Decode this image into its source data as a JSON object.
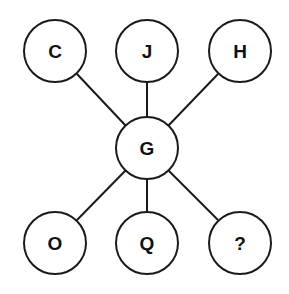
{
  "diagram": {
    "type": "letter-puzzle",
    "center": {
      "id": "G",
      "label": "G",
      "x": 147,
      "y": 148
    },
    "nodes": [
      {
        "id": "C",
        "label": "C",
        "x": 55,
        "y": 51
      },
      {
        "id": "J",
        "label": "J",
        "x": 147,
        "y": 51
      },
      {
        "id": "H",
        "label": "H",
        "x": 240,
        "y": 51
      },
      {
        "id": "O",
        "label": "O",
        "x": 55,
        "y": 243
      },
      {
        "id": "Q",
        "label": "Q",
        "x": 147,
        "y": 243
      },
      {
        "id": "unknown",
        "label": "?",
        "x": 240,
        "y": 243
      }
    ],
    "radius": 31,
    "colors": {
      "stroke": "#1a1a1a",
      "fill": "#ffffff",
      "text": "#111111"
    }
  }
}
